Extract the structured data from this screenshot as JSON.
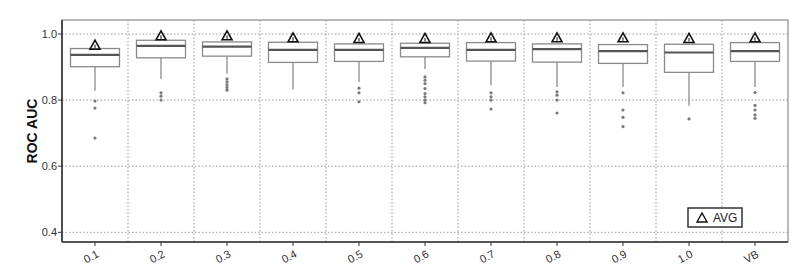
{
  "chart_data": {
    "type": "box",
    "title": "",
    "xlabel": "",
    "ylabel": "ROC AUC",
    "ylim": [
      0.373,
      1.042
    ],
    "yticks": [
      0.4,
      0.6,
      0.8,
      1.0
    ],
    "ytick_labels": [
      "0.4",
      "0.6",
      "0.8",
      "1.0"
    ],
    "grid": true,
    "grid_style": "dotted",
    "legend": {
      "position": "lower right",
      "entries": [
        {
          "marker": "triangle",
          "label": "AVG"
        }
      ]
    },
    "categories": [
      "0.1",
      "0.2",
      "0.3",
      "0.4",
      "0.5",
      "0.6",
      "0.7",
      "0.8",
      "0.9",
      "1.0",
      "VB"
    ],
    "series": [
      {
        "name": "0.1",
        "whisker_low": 0.828,
        "q1": 0.901,
        "median": 0.937,
        "q3": 0.956,
        "whisker_high": 0.956,
        "avg": 0.968,
        "outliers": [
          0.797,
          0.776,
          0.685
        ]
      },
      {
        "name": "0.2",
        "whisker_low": 0.864,
        "q1": 0.928,
        "median": 0.964,
        "q3": 0.981,
        "whisker_high": 0.981,
        "avg": 0.996,
        "outliers": [
          0.822,
          0.812,
          0.8
        ]
      },
      {
        "name": "0.3",
        "whisker_low": 0.88,
        "q1": 0.933,
        "median": 0.962,
        "q3": 0.976,
        "whisker_high": 0.976,
        "avg": 0.996,
        "outliers": [
          0.864,
          0.855,
          0.846,
          0.838,
          0.83
        ]
      },
      {
        "name": "0.4",
        "whisker_low": 0.833,
        "q1": 0.914,
        "median": 0.952,
        "q3": 0.975,
        "whisker_high": 0.975,
        "avg": 0.99,
        "outliers": []
      },
      {
        "name": "0.5",
        "whisker_low": 0.855,
        "q1": 0.917,
        "median": 0.952,
        "q3": 0.97,
        "whisker_high": 0.97,
        "avg": 0.988,
        "outliers": [
          0.836,
          0.822,
          0.795
        ]
      },
      {
        "name": "0.6",
        "whisker_low": 0.894,
        "q1": 0.931,
        "median": 0.958,
        "q3": 0.972,
        "whisker_high": 0.972,
        "avg": 0.988,
        "outliers": [
          0.87,
          0.86,
          0.85,
          0.835,
          0.82,
          0.81,
          0.8,
          0.792
        ]
      },
      {
        "name": "0.7",
        "whisker_low": 0.845,
        "q1": 0.918,
        "median": 0.952,
        "q3": 0.974,
        "whisker_high": 0.974,
        "avg": 0.99,
        "outliers": [
          0.822,
          0.81,
          0.8,
          0.773
        ]
      },
      {
        "name": "0.8",
        "whisker_low": 0.84,
        "q1": 0.915,
        "median": 0.954,
        "q3": 0.97,
        "whisker_high": 0.97,
        "avg": 0.99,
        "outliers": [
          0.825,
          0.815,
          0.8,
          0.761
        ]
      },
      {
        "name": "0.9",
        "whisker_low": 0.84,
        "q1": 0.911,
        "median": 0.948,
        "q3": 0.968,
        "whisker_high": 0.968,
        "avg": 0.99,
        "outliers": [
          0.822,
          0.77,
          0.748,
          0.72
        ]
      },
      {
        "name": "1.0",
        "whisker_low": 0.783,
        "q1": 0.884,
        "median": 0.944,
        "q3": 0.969,
        "whisker_high": 0.969,
        "avg": 0.988,
        "outliers": [
          0.743
        ]
      },
      {
        "name": "VB",
        "whisker_low": 0.84,
        "q1": 0.917,
        "median": 0.948,
        "q3": 0.974,
        "whisker_high": 0.974,
        "avg": 0.99,
        "outliers": [
          0.823,
          0.784,
          0.77,
          0.755,
          0.745
        ]
      }
    ]
  },
  "axis": {
    "y_title": "ROC AUC"
  },
  "legend": {
    "label": "AVG",
    "marker": "triangle-icon"
  },
  "colors": {
    "frame": "#333333",
    "box": "#8a8a8a",
    "median": "#555555",
    "outlier": "#7a7a7a",
    "grid": "#9a9a9a",
    "marker": "#111111"
  }
}
